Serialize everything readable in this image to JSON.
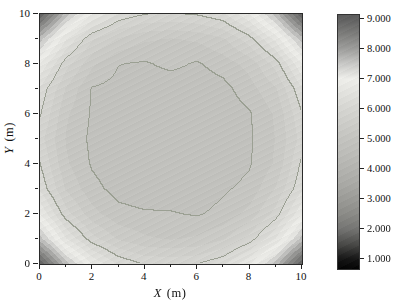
{
  "chart_data": {
    "type": "heatmap",
    "subtype": "filled-contour",
    "title": "",
    "x_axis": {
      "label_variable": "X",
      "label_unit": "(m)",
      "tick_labels": [
        "0",
        "2",
        "4",
        "6",
        "8",
        "10"
      ],
      "tick_values": [
        0,
        2,
        4,
        6,
        8,
        10
      ],
      "minor_tick_values": [
        1,
        3,
        5,
        7,
        9
      ],
      "range": [
        0,
        10
      ]
    },
    "y_axis": {
      "label_variable": "Y",
      "label_unit": "(m)",
      "tick_labels": [
        "0",
        "2",
        "4",
        "6",
        "8",
        "10"
      ],
      "tick_values": [
        0,
        2,
        4,
        6,
        8,
        10
      ],
      "minor_tick_values": [
        1,
        3,
        5,
        7,
        9
      ],
      "range": [
        0,
        10
      ]
    },
    "x": [
      0,
      1,
      2,
      3,
      4,
      5,
      6,
      7,
      8,
      9,
      10
    ],
    "y": [
      0,
      1,
      2,
      3,
      4,
      5,
      6,
      7,
      8,
      9,
      10
    ],
    "z_rows_top_to_bottom": [
      [
        9.0,
        7.62,
        6.74,
        6.21,
        6.02,
        5.98,
        6.04,
        6.21,
        6.74,
        7.62,
        9.0
      ],
      [
        7.62,
        6.52,
        5.78,
        5.47,
        5.29,
        5.23,
        5.29,
        5.47,
        5.9,
        6.58,
        7.62
      ],
      [
        6.74,
        5.85,
        5.3,
        5.01,
        4.97,
        5.07,
        4.97,
        5.12,
        5.34,
        5.85,
        6.74
      ],
      [
        6.21,
        5.47,
        4.98,
        4.91,
        4.84,
        4.83,
        4.84,
        4.91,
        5.15,
        5.47,
        6.21
      ],
      [
        6.04,
        5.29,
        4.97,
        4.84,
        4.81,
        4.8,
        4.81,
        4.84,
        4.97,
        5.29,
        5.98
      ],
      [
        5.85,
        5.23,
        4.94,
        4.83,
        4.8,
        4.8,
        4.8,
        4.83,
        4.96,
        5.26,
        5.85
      ],
      [
        6.02,
        5.29,
        4.97,
        4.84,
        4.81,
        4.8,
        4.81,
        4.84,
        4.97,
        5.29,
        6.05
      ],
      [
        6.21,
        5.47,
        5.08,
        4.91,
        4.84,
        4.83,
        4.84,
        4.96,
        5.08,
        5.52,
        6.21
      ],
      [
        6.74,
        5.85,
        5.34,
        5.08,
        5.03,
        5.02,
        4.97,
        5.08,
        5.34,
        5.85,
        6.74
      ],
      [
        7.62,
        6.52,
        5.85,
        5.47,
        5.29,
        5.23,
        5.29,
        5.47,
        5.85,
        6.52,
        7.62
      ],
      [
        9.0,
        7.62,
        6.74,
        6.21,
        5.97,
        5.95,
        5.99,
        6.21,
        6.74,
        7.62,
        9.0
      ]
    ],
    "band_step": 0.25,
    "contour_line_levels": [
      5,
      6
    ],
    "contour_line_color": "#9ba093",
    "colormap_stops": [
      [
        0.6,
        "#000000"
      ],
      [
        1.0,
        "#161616"
      ],
      [
        1.5,
        "#4a4a48"
      ],
      [
        2.0,
        "#747472"
      ],
      [
        2.5,
        "#8b8b87"
      ],
      [
        3.0,
        "#9b9b97"
      ],
      [
        3.5,
        "#a9a9a5"
      ],
      [
        4.0,
        "#b3b3af"
      ],
      [
        4.5,
        "#bcbcb8"
      ],
      [
        5.0,
        "#c3c3bf"
      ],
      [
        5.5,
        "#ccccc8"
      ],
      [
        6.0,
        "#d5d5d1"
      ],
      [
        6.5,
        "#e1e1dd"
      ],
      [
        7.0,
        "#eeeeea"
      ],
      [
        7.5,
        "#c8c8c6"
      ],
      [
        8.0,
        "#9d9d9b"
      ],
      [
        8.5,
        "#7d7d7b"
      ],
      [
        9.0,
        "#606060"
      ],
      [
        9.3,
        "#585858"
      ]
    ],
    "colorbar": {
      "tick_labels": [
        "9.000",
        "8.000",
        "7.000",
        "6.000",
        "5.000",
        "4.000",
        "3.000",
        "2.000",
        "1.000"
      ],
      "tick_values": [
        9,
        8,
        7,
        6,
        5,
        4,
        3,
        2,
        1
      ],
      "bar_value_top": 9.13,
      "bar_value_bottom": 0.67
    }
  }
}
